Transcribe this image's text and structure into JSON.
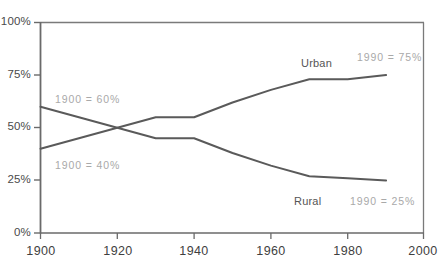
{
  "chart_data": {
    "type": "line",
    "title": "",
    "xlabel": "",
    "ylabel": "",
    "xlim": [
      1900,
      2000
    ],
    "ylim": [
      0,
      100
    ],
    "grid": false,
    "legend_position": "inline-right",
    "x_ticks": [
      "1900",
      "1920",
      "1940",
      "1960",
      "1980",
      "2000"
    ],
    "y_ticks": [
      "0%",
      "25%",
      "50%",
      "75%",
      "100%"
    ],
    "x": [
      1900,
      1910,
      1920,
      1930,
      1940,
      1950,
      1960,
      1970,
      1980,
      1990
    ],
    "series": [
      {
        "name": "Urban",
        "values": [
          40,
          45,
          50,
          55,
          55,
          62,
          68,
          73,
          73,
          75
        ]
      },
      {
        "name": "Rural",
        "values": [
          60,
          55,
          50,
          45,
          45,
          38,
          32,
          27,
          26,
          25
        ]
      }
    ],
    "annotations": [
      {
        "key": "urban_start",
        "text": "1900 = 40%"
      },
      {
        "key": "rural_start",
        "text": "1900 = 60%"
      },
      {
        "key": "urban_end",
        "text": "1990 = 75%"
      },
      {
        "key": "rural_end",
        "text": "1990 = 25%"
      }
    ]
  },
  "axes": {
    "y_labels": [
      "100%",
      "75%",
      "50%",
      "25%",
      "0%"
    ],
    "x_labels": [
      "1900",
      "1920",
      "1940",
      "1960",
      "1980",
      "2000"
    ]
  },
  "labels": {
    "urban": "Urban",
    "rural": "Rural"
  },
  "annotations": {
    "rural_start": "1900 = 60%",
    "urban_start": "1900 = 40%",
    "urban_end": "1990 = 75%",
    "rural_end": "1990 = 25%"
  },
  "colors": {
    "line": "#5a5a5a",
    "axis": "#6a6a6a",
    "tick_text": "#3f3f3f",
    "series_label": "#555555",
    "annotation": "#a9a9a9",
    "background": "#ffffff"
  }
}
